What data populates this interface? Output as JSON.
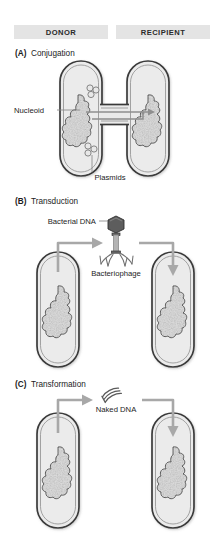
{
  "header": {
    "donor_label": "DONOR",
    "recipient_label": "RECIPIENT"
  },
  "sections": [
    {
      "tag": "(A)",
      "name": "Conjugation",
      "labels": {
        "nucleoid": "Nucleoid",
        "plasmids": "Plasmids"
      }
    },
    {
      "tag": "(B)",
      "name": "Transduction",
      "labels": {
        "bacterial_dna": "Bacterial DNA",
        "bacteriophage": "Bacteriophage"
      }
    },
    {
      "tag": "(C)",
      "name": "Transformation",
      "labels": {
        "naked_dna": "Naked DNA"
      }
    }
  ],
  "colors": {
    "header_band": "#e4e4e4",
    "cell_fill": "#ebebeb",
    "cell_stroke": "#3a3a3a",
    "nucleoid_fill": "#dedede",
    "arrow_gray": "#a8a8a8",
    "phage_head": "#5d5d5d",
    "text": "#1c1c1c",
    "background": "#ffffff"
  },
  "icons": {
    "bacteriophage": "bacteriophage-icon",
    "naked_dna": "naked-dna-squiggle-icon",
    "plasmid_ring": "plasmid-ring-icon",
    "nucleoid_mass": "nucleoid-icon",
    "flow_arrow": "flow-arrow-icon",
    "transfer_arrow": "transfer-arrow-icon"
  }
}
